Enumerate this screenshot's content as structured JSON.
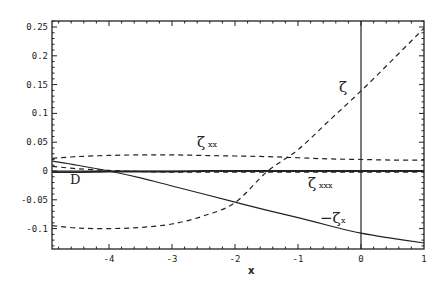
{
  "chart_data": {
    "type": "line",
    "title": "",
    "xlabel": "x",
    "ylabel": "",
    "xlim": [
      -4.9,
      1.0
    ],
    "ylim": [
      -0.135,
      0.26
    ],
    "grid": false,
    "x_ticks": [
      -4,
      -3,
      -2,
      -1,
      0,
      1
    ],
    "x_tick_labels": [
      "-4",
      "-3",
      "-2",
      "-1",
      "0",
      "1"
    ],
    "y_ticks": [
      0.25,
      0.2,
      0.15,
      0.1,
      0.05,
      0,
      -0.05,
      -0.1
    ],
    "y_tick_labels": [
      "0.25",
      "0.2",
      "0.15",
      "0.1",
      "0.05",
      "0",
      "-0.05",
      "-0.1"
    ],
    "vertical_line_x": 0,
    "horizontal_line_y": 0,
    "x": [
      -4.9,
      -4.5,
      -4.0,
      -3.5,
      -3.0,
      -2.5,
      -2.0,
      -1.5,
      -1.0,
      -0.5,
      0.0,
      0.5,
      1.0
    ],
    "series": [
      {
        "name": "ζ",
        "style": "dashed",
        "values": [
          -0.095,
          -0.099,
          -0.1,
          -0.098,
          -0.092,
          -0.078,
          -0.055,
          -0.002,
          0.037,
          0.088,
          0.139,
          0.193,
          0.248
        ]
      },
      {
        "name": "ζxx",
        "style": "dashed",
        "values": [
          0.022,
          0.025,
          0.027,
          0.028,
          0.028,
          0.027,
          0.026,
          0.025,
          0.023,
          0.021,
          0.02,
          0.019,
          0.019
        ]
      },
      {
        "name": "ζxxx",
        "style": "dashed",
        "values": [
          0.008,
          0.004,
          0.001,
          -0.001,
          -0.002,
          -0.002,
          -0.002,
          -0.002,
          -0.002,
          -0.002,
          -0.002,
          -0.002,
          -0.002
        ]
      },
      {
        "name": "−ζx",
        "style": "solid",
        "values": [
          0.017,
          0.01,
          0.0,
          -0.012,
          -0.026,
          -0.04,
          -0.054,
          -0.068,
          -0.081,
          -0.095,
          -0.108,
          -0.117,
          -0.125
        ]
      },
      {
        "name": "D",
        "style": "solid",
        "values": [
          -0.002,
          -0.002,
          -0.001,
          -0.001,
          -0.001,
          0.0,
          0.0,
          0.0,
          0.0,
          0.0,
          0.0,
          0.0,
          0.0
        ]
      }
    ],
    "annotations": [
      {
        "text": "ζ",
        "x": -0.3,
        "y": 0.15
      },
      {
        "text": "ζxx",
        "x": -2.5,
        "y": 0.04
      },
      {
        "text": "ζxxx",
        "x": -0.8,
        "y": -0.016
      },
      {
        "text": "−ζx",
        "x": -0.45,
        "y": -0.087
      },
      {
        "text": "D",
        "x": -4.6,
        "y": -0.013
      }
    ]
  },
  "labels": {
    "zeta": "ζ",
    "zeta_xx_main": "ζ",
    "zeta_xx_sub": "xx",
    "zeta_xxx_main": "ζ",
    "zeta_xxx_sub": "xxx",
    "neg_zeta_x_main": "−ζ",
    "neg_zeta_x_sub": "x",
    "D": "D",
    "x_axis": "x"
  }
}
